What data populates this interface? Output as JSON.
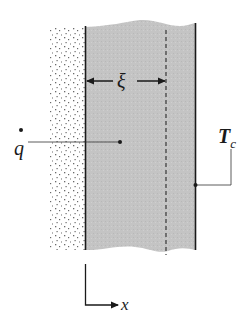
{
  "diagram": {
    "type": "solidification-slab-schematic",
    "labels": {
      "heat_flux": "q",
      "front_distance": "ξ",
      "temperature_main": "T",
      "temperature_sub": "c",
      "axis": "x"
    },
    "regions": [
      {
        "name": "stippled-wall",
        "fill": "stipple"
      },
      {
        "name": "solid-layer",
        "fill": "#c4c4c4"
      }
    ],
    "colors": {
      "ink": "#1a1a1a",
      "grey_fill": "#c4c4c4",
      "stipple": "#555555",
      "background": "#ffffff"
    }
  }
}
